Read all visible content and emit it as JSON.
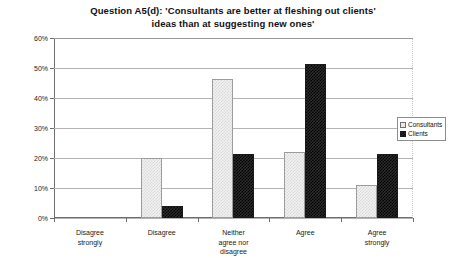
{
  "chart_data": {
    "type": "bar",
    "title": "Question A5(d): 'Consultants are better at fleshing out clients' ideas than at suggesting new ones'",
    "title_lines": [
      "Question A5(d): 'Consultants are better at fleshing out clients'",
      "ideas than at suggesting new ones'"
    ],
    "categories": [
      "Disagree strongly",
      "Disagree",
      "Neither agree nor disagree",
      "Agree",
      "Agree strongly"
    ],
    "category_lines": [
      [
        "Disagree",
        "strongly"
      ],
      [
        "Disagree"
      ],
      [
        "Neither",
        "agree nor",
        "disagree"
      ],
      [
        "Agree"
      ],
      [
        "Agree",
        "strongly"
      ]
    ],
    "series": [
      {
        "name": "Consultants",
        "values": [
          0,
          20,
          46.5,
          22,
          11
        ],
        "color": "#f2f2f2",
        "pattern": "light-checker"
      },
      {
        "name": "Clients",
        "values": [
          0,
          4,
          21.5,
          51.5,
          21.5
        ],
        "color": "#2b2b2b",
        "pattern": "dark-checker"
      }
    ],
    "xlabel": "",
    "ylabel": "",
    "ylim": [
      0,
      60
    ],
    "ytick_values": [
      0,
      10,
      20,
      30,
      40,
      50,
      60
    ],
    "ytick_labels": [
      "0%",
      "10%",
      "20%",
      "30%",
      "40%",
      "50%",
      "60%"
    ],
    "grid": true,
    "legend_position": "right"
  },
  "legend": {
    "entries": [
      {
        "label": "Consultants"
      },
      {
        "label": "Clients"
      }
    ]
  }
}
